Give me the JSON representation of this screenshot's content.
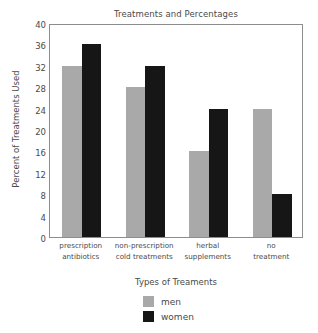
{
  "chart_data": {
    "type": "bar",
    "title": "Treatments and Percentages",
    "xlabel": "Types of Treaments",
    "ylabel": "Percent of Treatments Used",
    "categories": [
      "prescription antibiotics",
      "non-prescription cold treatments",
      "herbal supplements",
      "no treatment"
    ],
    "category_lines": [
      [
        "prescription",
        "antibiotics"
      ],
      [
        "non-prescription",
        "cold treatments"
      ],
      [
        "herbal",
        "supplements"
      ],
      [
        "no",
        "treatment"
      ]
    ],
    "series": [
      {
        "name": "men",
        "color": "#a9a9a9",
        "values": [
          32,
          28,
          16,
          24
        ]
      },
      {
        "name": "women",
        "color": "#161616",
        "values": [
          36,
          32,
          24,
          8
        ]
      }
    ],
    "ylim": [
      0,
      40
    ],
    "yticks": [
      0,
      4,
      8,
      12,
      16,
      20,
      24,
      28,
      32,
      36,
      40
    ],
    "ytick_labels": [
      "0",
      "4",
      "8",
      "12",
      "16",
      "20",
      "24",
      "28",
      "32",
      "36",
      "40"
    ],
    "grid": false,
    "legend_position": "below-axis-center",
    "legend": [
      {
        "label": "men",
        "color": "#a9a9a9"
      },
      {
        "label": "women",
        "color": "#161616"
      }
    ]
  }
}
